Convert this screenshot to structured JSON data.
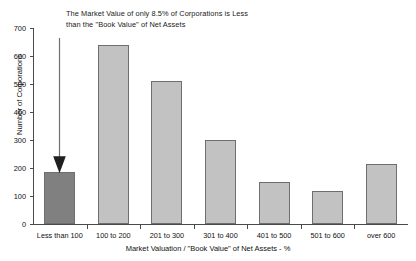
{
  "chart_data": {
    "type": "bar",
    "title": "",
    "annotation": "The Market Value of only 8.5% of Corporations is Less\nthan the \"Book Value\" of Net Assets",
    "categories": [
      "Less than 100",
      "100 to 200",
      "201 to 300",
      "301 to 400",
      "401 to 500",
      "501 to 600",
      "over 600"
    ],
    "values": [
      185,
      640,
      512,
      300,
      150,
      118,
      213
    ],
    "xlabel": "Market Valuation  / \"Book Value\" of Net Assets  - %",
    "ylabel": "Number of Corporations",
    "ylim": [
      0,
      700
    ],
    "yticks": [
      0,
      100,
      200,
      300,
      400,
      500,
      600,
      700
    ],
    "ytick_labels": [
      "0",
      "100",
      "200",
      "300",
      "400",
      "500",
      "600",
      "700"
    ],
    "grid": false,
    "legend": null,
    "bar_colors": [
      "#808080",
      "#c2c2c2",
      "#c2c2c2",
      "#c2c2c2",
      "#c2c2c2",
      "#c2c2c2",
      "#c2c2c2"
    ],
    "bar_edge_color": "#6e6e6e",
    "highlight_index": 0,
    "axis_color": "#4a4a4a",
    "background": "#ffffff",
    "annotation_arrow": {
      "label": "down-arrow",
      "points_to_category": "Less than 100",
      "color": "#2b2b2b"
    }
  }
}
